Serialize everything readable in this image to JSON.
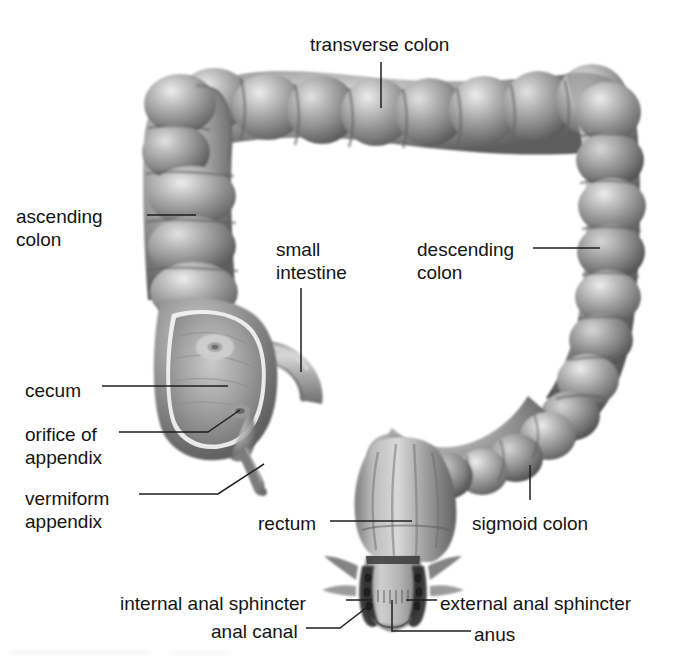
{
  "figure": {
    "style": "grayscale pencil anatomical illustration",
    "background_color": "#ffffff",
    "text_color": "#141414",
    "leader_color": "#1e1e1e"
  },
  "labels": [
    {
      "id": "transverse-colon",
      "text": "transverse colon",
      "x": 310,
      "y": 33,
      "align": "left"
    },
    {
      "id": "ascending-colon",
      "text": "ascending\ncolon",
      "x": 16,
      "y": 205,
      "align": "left"
    },
    {
      "id": "small-intestine",
      "text": "small\nintestine",
      "x": 276,
      "y": 238,
      "align": "left"
    },
    {
      "id": "descending-colon",
      "text": "descending\ncolon",
      "x": 417,
      "y": 238,
      "align": "left"
    },
    {
      "id": "cecum",
      "text": "cecum",
      "x": 25,
      "y": 379,
      "align": "left"
    },
    {
      "id": "orifice-of-appendix",
      "text": "orifice of\nappendix",
      "x": 25,
      "y": 423,
      "align": "left"
    },
    {
      "id": "vermiform-appendix",
      "text": "vermiform\nappendix",
      "x": 25,
      "y": 487,
      "align": "left"
    },
    {
      "id": "rectum",
      "text": "rectum",
      "x": 258,
      "y": 512,
      "align": "left"
    },
    {
      "id": "sigmoid-colon",
      "text": "sigmoid colon",
      "x": 472,
      "y": 512,
      "align": "left"
    },
    {
      "id": "internal-anal-sphincter",
      "text": "internal anal sphincter",
      "x": 120,
      "y": 592,
      "align": "left"
    },
    {
      "id": "external-anal-sphincter",
      "text": "external anal sphincter",
      "x": 440,
      "y": 592,
      "align": "left"
    },
    {
      "id": "anal-canal",
      "text": "anal canal",
      "x": 211,
      "y": 620,
      "align": "left"
    },
    {
      "id": "anus",
      "text": "anus",
      "x": 474,
      "y": 623,
      "align": "left"
    }
  ],
  "leaders": [
    {
      "id": "leader-transverse-colon",
      "points": "381,62 381,108"
    },
    {
      "id": "leader-ascending-colon",
      "points": "147,215 196,215"
    },
    {
      "id": "leader-small-intestine",
      "points": "301,288 301,372"
    },
    {
      "id": "leader-descending-colon",
      "points": "533,248 600,248"
    },
    {
      "id": "leader-cecum",
      "points": "102,386 228,386"
    },
    {
      "id": "leader-orifice-of-appendix",
      "points": "119,432 208,432 240,410"
    },
    {
      "id": "leader-vermiform-appendix",
      "points": "139,494 218,494 264,464"
    },
    {
      "id": "leader-rectum",
      "points": "330,521 412,521"
    },
    {
      "id": "leader-sigmoid-colon",
      "points": "530,500 530,465"
    },
    {
      "id": "leader-internal-anal-sphincter",
      "points": "346,600 372,600"
    },
    {
      "id": "leader-external-anal-sphincter",
      "points": "437,600 406,600"
    },
    {
      "id": "leader-anal-canal",
      "points": "306,628 340,628 366,608"
    },
    {
      "id": "leader-anus",
      "points": "471,631 392,631 392,600"
    }
  ],
  "structures": [
    {
      "id": "transverse-colon",
      "name": "transverse colon",
      "description": "horizontal haustrated segment across the top"
    },
    {
      "id": "ascending-colon",
      "name": "ascending colon",
      "description": "vertical haustrated segment on the left"
    },
    {
      "id": "descending-colon",
      "name": "descending colon",
      "description": "vertical haustrated segment on the right"
    },
    {
      "id": "sigmoid-colon",
      "name": "sigmoid colon",
      "description": "S-shaped curved segment at lower right"
    },
    {
      "id": "cecum",
      "name": "cecum",
      "description": "pouch at lower left, cut open to show interior"
    },
    {
      "id": "small-intestine",
      "name": "small intestine",
      "description": "smooth ileum tube entering the cecum"
    },
    {
      "id": "vermiform-appendix",
      "name": "vermiform appendix",
      "description": "small tapering tube below the cecum"
    },
    {
      "id": "orifice-of-appendix",
      "name": "orifice of appendix",
      "description": "opening inside the cecum wall"
    },
    {
      "id": "rectum",
      "name": "rectum",
      "description": "wide terminal chamber at bottom center"
    },
    {
      "id": "anal-canal",
      "name": "anal canal",
      "description": "short canal below the rectum"
    },
    {
      "id": "internal-anal-sphincter",
      "name": "internal anal sphincter",
      "description": "inner dark muscle band"
    },
    {
      "id": "external-anal-sphincter",
      "name": "external anal sphincter",
      "description": "outer dark muscle band"
    },
    {
      "id": "anus",
      "name": "anus",
      "description": "terminal opening"
    }
  ]
}
